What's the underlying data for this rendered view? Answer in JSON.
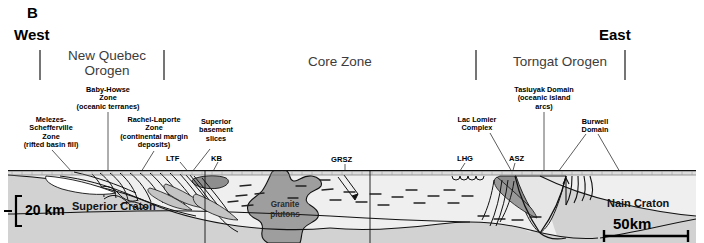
{
  "panel": {
    "letter": "B"
  },
  "directions": {
    "west": "West",
    "east": "East"
  },
  "orogens": [
    {
      "name": "new-quebec-orogen",
      "line1": "New Quebec",
      "line2": "Orogen"
    },
    {
      "name": "core-zone",
      "line1": "Core Zone",
      "line2": ""
    },
    {
      "name": "torngat-orogen",
      "line1": "Torngat Orogen",
      "line2": ""
    }
  ],
  "zone_labels": [
    {
      "name": "melezes-schefferville-zone",
      "lines": [
        "Melezes-",
        "Schefferville",
        "Zone",
        "(rifted basin fill)"
      ]
    },
    {
      "name": "baby-howse-zone",
      "lines": [
        "Baby-Howse",
        "Zone",
        "(oceanic terranes)"
      ]
    },
    {
      "name": "rachel-laporte-zone",
      "lines": [
        "Rachel-Laporte",
        "Zone",
        "(continental margin",
        "deposits)"
      ]
    },
    {
      "name": "superior-basement-slices",
      "lines": [
        "Superior",
        "basement",
        "slices"
      ]
    },
    {
      "name": "lac-lomier-complex",
      "lines": [
        "Lac Lomier",
        "Complex"
      ]
    },
    {
      "name": "tasiuyak-domain",
      "lines": [
        "Tasiuyak Domain",
        "(oceanic island",
        "arcs)"
      ]
    },
    {
      "name": "burwell-domain",
      "lines": [
        "Burwell",
        "Domain"
      ]
    }
  ],
  "abbreviations": [
    {
      "name": "ltf",
      "text": "LTF"
    },
    {
      "name": "kb",
      "text": "KB"
    },
    {
      "name": "grsz",
      "text": "GRSZ"
    },
    {
      "name": "lhg",
      "text": "LHG"
    },
    {
      "name": "asz",
      "text": "ASZ"
    }
  ],
  "section_labels": [
    {
      "name": "superior-craton",
      "text": "Superior Craton"
    },
    {
      "name": "nain-craton",
      "text": "Nain Craton"
    }
  ],
  "pluton": {
    "line1": "Granite",
    "line2": "plutons"
  },
  "scales": {
    "vertical": "20 km",
    "horizontal": "50km"
  },
  "colors": {
    "crust_fill": "#d2d2d2",
    "upper_light": "#efefef",
    "pluton_fill": "#9e9e9e",
    "mid_gray": "#bcbcbc",
    "dark_gray": "#8e8e8e",
    "orogen_text": "#3c3c3c",
    "stroke": "#000000"
  }
}
